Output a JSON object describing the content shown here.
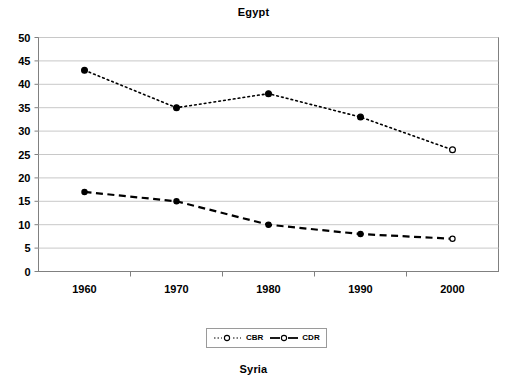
{
  "chart_data": {
    "type": "line",
    "title": "Egypt",
    "xlabel": "",
    "ylabel": "",
    "x": [
      1960,
      1970,
      1980,
      1990,
      2000
    ],
    "categories": [
      "1960",
      "1970",
      "1980",
      "1990",
      "2000"
    ],
    "series": [
      {
        "name": "CBR",
        "values": [
          43,
          35,
          38,
          33,
          26
        ],
        "line_style": "dotted",
        "marker": "circle",
        "color": "#000000"
      },
      {
        "name": "CDR",
        "values": [
          17,
          15,
          10,
          8,
          7
        ],
        "line_style": "dashed",
        "marker": "circle",
        "color": "#000000"
      }
    ],
    "ylim": [
      0,
      50
    ],
    "ytick_labels": [
      "0",
      "5",
      "10",
      "15",
      "20",
      "25",
      "30",
      "35",
      "40",
      "45",
      "50"
    ],
    "ytick_values": [
      0,
      5,
      10,
      15,
      20,
      25,
      30,
      35,
      40,
      45,
      50
    ],
    "xtick_labels": [
      "1960",
      "1970",
      "1980",
      "1990",
      "2000"
    ],
    "grid": "horizontal",
    "legend_position": "bottom",
    "legend_entries": [
      "CBR",
      "CDR"
    ],
    "plot_border_color": "#808080",
    "gridline_color": "#c8c8c8"
  },
  "next_chart": {
    "title": "Syria"
  }
}
